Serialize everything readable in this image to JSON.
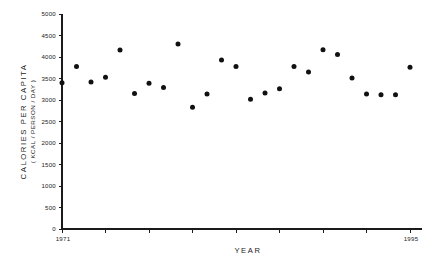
{
  "chart_data": {
    "type": "scatter",
    "title": "",
    "xlabel": "YEAR",
    "ylabel": "CALORIES  PER  CAPITA",
    "ylabel_sub": "( KCAL / PERSON / DAY )",
    "xlim": [
      1971,
      1995
    ],
    "ylim": [
      0,
      5000
    ],
    "grid": false,
    "legend": null,
    "y_ticks": [
      0,
      500,
      1000,
      1500,
      2000,
      2500,
      3000,
      3500,
      4000,
      4500,
      5000
    ],
    "y_tick_labels": [
      "0",
      "500",
      "1000",
      "1500",
      "2000",
      "2500",
      "3000",
      "3500",
      "4000",
      "4500",
      "5000"
    ],
    "x_tick_labels_shown": [
      "1971",
      "1995"
    ],
    "x_tick_years": [
      1971,
      1974,
      1977,
      1980,
      1983,
      1986,
      1989,
      1992,
      1995
    ],
    "marker": "filled-circle",
    "marker_color": "#111111",
    "x": [
      1971,
      1972,
      1973,
      1974,
      1975,
      1976,
      1977,
      1978,
      1979,
      1980,
      1981,
      1982,
      1983,
      1984,
      1985,
      1986,
      1987,
      1988,
      1989,
      1990,
      1991,
      1992,
      1993,
      1994,
      1995
    ],
    "y": [
      3400,
      3780,
      3420,
      3530,
      4160,
      3150,
      3390,
      3290,
      4300,
      2830,
      3140,
      3930,
      3780,
      3020,
      3160,
      3260,
      3780,
      3650,
      4170,
      4060,
      3510,
      3140,
      3120,
      3120,
      3760
    ]
  }
}
